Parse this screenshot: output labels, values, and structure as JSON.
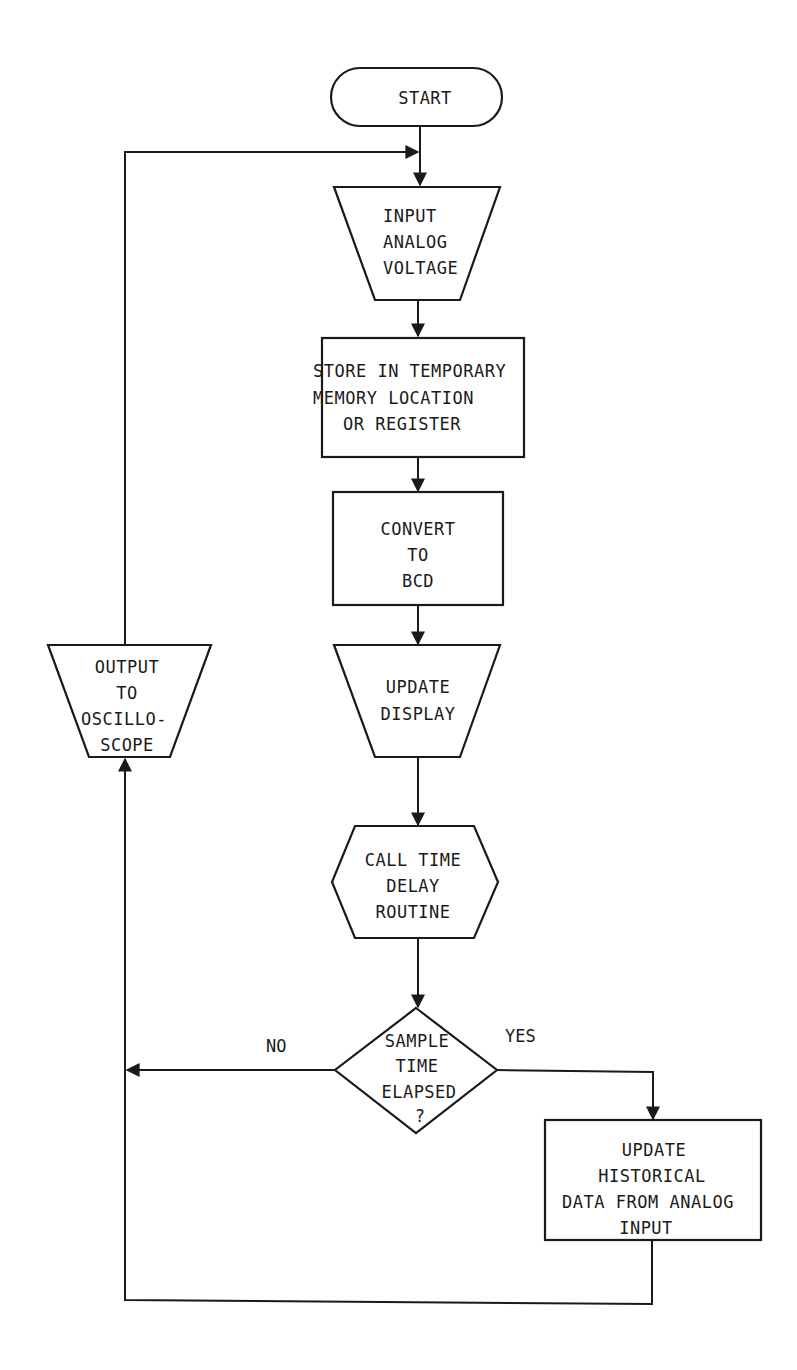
{
  "diagram": {
    "type": "flowchart",
    "nodes": {
      "start": {
        "shape": "terminal",
        "lines": [
          "START"
        ]
      },
      "input": {
        "shape": "manual-input-trapezoid",
        "lines": [
          "INPUT",
          "ANALOG",
          "VOLTAGE"
        ]
      },
      "store": {
        "shape": "process",
        "lines": [
          "STORE IN TEMPORARY",
          "MEMORY LOCATION",
          "OR REGISTER"
        ]
      },
      "convert": {
        "shape": "process",
        "lines": [
          "CONVERT",
          "TO",
          "BCD"
        ]
      },
      "display": {
        "shape": "manual-operation-trapezoid",
        "lines": [
          "UPDATE",
          "DISPLAY"
        ]
      },
      "delay": {
        "shape": "preparation-hexagon",
        "lines": [
          "CALL TIME",
          "DELAY",
          "ROUTINE"
        ]
      },
      "decision": {
        "shape": "decision",
        "lines": [
          "SAMPLE",
          "TIME",
          "ELAPSED",
          "?"
        ]
      },
      "historical": {
        "shape": "process",
        "lines": [
          "UPDATE",
          "HISTORICAL",
          "DATA FROM ANALOG",
          "INPUT"
        ]
      },
      "output": {
        "shape": "manual-operation-trapezoid",
        "lines": [
          "OUTPUT",
          "TO",
          "OSCILLO-",
          "SCOPE"
        ]
      }
    },
    "branch_labels": {
      "no": "NO",
      "yes": "YES"
    },
    "edges": [
      {
        "from": "start",
        "to": "input"
      },
      {
        "from": "input",
        "to": "store"
      },
      {
        "from": "store",
        "to": "convert"
      },
      {
        "from": "convert",
        "to": "display"
      },
      {
        "from": "display",
        "to": "delay"
      },
      {
        "from": "delay",
        "to": "decision"
      },
      {
        "from": "decision",
        "to": "output",
        "label": "NO"
      },
      {
        "from": "decision",
        "to": "historical",
        "label": "YES"
      },
      {
        "from": "historical",
        "to": "output"
      },
      {
        "from": "output",
        "to": "input"
      }
    ]
  }
}
